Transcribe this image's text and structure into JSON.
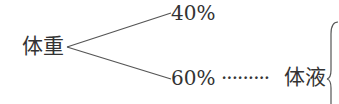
{
  "diagram": {
    "root": "体重",
    "branches": [
      {
        "label": "40%"
      },
      {
        "label": "60%",
        "leader": "·········",
        "child": "体液"
      }
    ]
  }
}
